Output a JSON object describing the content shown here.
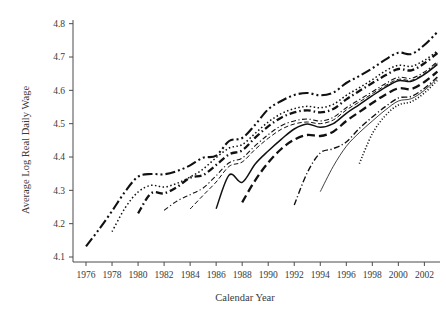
{
  "chart_data": {
    "type": "line",
    "title": "",
    "xlabel": "Calendar Year",
    "ylabel": "Average Log Real Daily Wage",
    "xlim": [
      1975,
      2003.2
    ],
    "ylim": [
      4.085,
      4.805
    ],
    "xticks": [
      1976,
      1978,
      1980,
      1982,
      1984,
      1986,
      1988,
      1990,
      1992,
      1994,
      1996,
      1998,
      2000,
      2002
    ],
    "xtick_labels": [
      "1976",
      "1978",
      "1980",
      "1982",
      "1984",
      "1986",
      "1988",
      "1990",
      "1992",
      "1994",
      "1996",
      "1998",
      "2000",
      "2002"
    ],
    "yticks": [
      4.1,
      4.2,
      4.3,
      4.4,
      4.5,
      4.6,
      4.7,
      4.8
    ],
    "ytick_labels": [
      "4.1",
      "4.2",
      "4.3",
      "4.4",
      "4.5",
      "4.6",
      "4.7",
      "4.8"
    ],
    "grid": false,
    "legend": "none",
    "line_color": "#111111",
    "series": [
      {
        "name": "cohort-1976",
        "dash": "10,3,2,3,2,3",
        "width": 2.1,
        "x": [
          1976,
          1977,
          1978,
          1979,
          1980,
          1981,
          1982,
          1983,
          1984,
          1985,
          1986,
          1987,
          1988,
          1989,
          1990,
          1991,
          1992,
          1993,
          1994,
          1995,
          1996,
          1997,
          1998,
          1999,
          2000,
          2001,
          2002,
          2003
        ],
        "values": [
          4.132,
          4.183,
          4.238,
          4.296,
          4.341,
          4.349,
          4.348,
          4.358,
          4.375,
          4.398,
          4.404,
          4.448,
          4.457,
          4.497,
          4.543,
          4.568,
          4.586,
          4.592,
          4.585,
          4.593,
          4.622,
          4.643,
          4.666,
          4.692,
          4.713,
          4.709,
          4.736,
          4.775
        ]
      },
      {
        "name": "cohort-1978",
        "dash": "1.5,2.4",
        "width": 1.5,
        "x": [
          1978,
          1979,
          1980,
          1981,
          1982,
          1983,
          1984,
          1985,
          1986,
          1987,
          1988,
          1989,
          1990,
          1991,
          1992,
          1993,
          1994,
          1995,
          1996,
          1997,
          1998,
          1999,
          2000,
          2001,
          2002,
          2003
        ],
        "values": [
          4.176,
          4.247,
          4.295,
          4.315,
          4.31,
          4.321,
          4.34,
          4.364,
          4.398,
          4.427,
          4.437,
          4.471,
          4.505,
          4.53,
          4.545,
          4.552,
          4.548,
          4.558,
          4.585,
          4.608,
          4.632,
          4.658,
          4.675,
          4.672,
          4.69,
          4.718
        ]
      },
      {
        "name": "cohort-1980",
        "dash": "7,3,1.5,3",
        "width": 2.3,
        "x": [
          1980,
          1981,
          1982,
          1983,
          1984,
          1985,
          1986,
          1987,
          1988,
          1989,
          1990,
          1991,
          1992,
          1993,
          1994,
          1995,
          1996,
          1997,
          1998,
          1999,
          2000,
          2001,
          2002,
          2003
        ],
        "values": [
          4.231,
          4.291,
          4.291,
          4.31,
          4.338,
          4.346,
          4.376,
          4.408,
          4.42,
          4.458,
          4.492,
          4.518,
          4.534,
          4.54,
          4.534,
          4.544,
          4.573,
          4.598,
          4.622,
          4.645,
          4.664,
          4.66,
          4.681,
          4.712
        ]
      },
      {
        "name": "cohort-1982",
        "dash": "5,2.5,1.2,2.5",
        "width": 1.1,
        "x": [
          1982,
          1983,
          1984,
          1985,
          1986,
          1987,
          1988,
          1989,
          1990,
          1991,
          1992,
          1993,
          1994,
          1995,
          1996,
          1997,
          1998,
          1999,
          2000,
          2001,
          2002,
          2003
        ],
        "values": [
          4.24,
          4.268,
          4.287,
          4.307,
          4.344,
          4.383,
          4.397,
          4.434,
          4.467,
          4.494,
          4.508,
          4.514,
          4.508,
          4.519,
          4.548,
          4.572,
          4.596,
          4.62,
          4.639,
          4.636,
          4.655,
          4.686
        ]
      },
      {
        "name": "cohort-1984",
        "dash": "4.5,2.5",
        "width": 1.0,
        "x": [
          1984,
          1985,
          1986,
          1987,
          1988,
          1989,
          1990,
          1991,
          1992,
          1993,
          1994,
          1995,
          1996,
          1997,
          1998,
          1999,
          2000,
          2001,
          2002,
          2003
        ],
        "values": [
          4.244,
          4.285,
          4.325,
          4.372,
          4.385,
          4.423,
          4.456,
          4.483,
          4.499,
          4.505,
          4.5,
          4.511,
          4.541,
          4.565,
          4.59,
          4.614,
          4.633,
          4.63,
          4.65,
          4.681
        ]
      },
      {
        "name": "cohort-1986",
        "dash": "none",
        "width": 1.5,
        "x": [
          1986,
          1987,
          1988,
          1989,
          1990,
          1991,
          1992,
          1993,
          1994,
          1995,
          1996,
          1997,
          1998,
          1999,
          2000,
          2001,
          2002,
          2003
        ],
        "values": [
          4.245,
          4.346,
          4.324,
          4.379,
          4.418,
          4.453,
          4.484,
          4.499,
          4.489,
          4.5,
          4.531,
          4.557,
          4.584,
          4.609,
          4.629,
          4.627,
          4.648,
          4.678
        ]
      },
      {
        "name": "cohort-1988",
        "dash": "8,4",
        "width": 2.3,
        "x": [
          1988,
          1989,
          1990,
          1991,
          1992,
          1993,
          1994,
          1995,
          1996,
          1997,
          1998,
          1999,
          2000,
          2001,
          2002,
          2003
        ],
        "values": [
          4.264,
          4.33,
          4.383,
          4.424,
          4.452,
          4.466,
          4.463,
          4.476,
          4.508,
          4.535,
          4.562,
          4.587,
          4.606,
          4.604,
          4.625,
          4.656
        ]
      },
      {
        "name": "cohort-1992",
        "dash": "6,2.5,1.2,2.5",
        "width": 1.4,
        "x": [
          1992,
          1993,
          1994,
          1995,
          1996,
          1997,
          1998,
          1999,
          2000,
          2001,
          2002,
          2003
        ],
        "values": [
          4.256,
          4.353,
          4.412,
          4.425,
          4.445,
          4.486,
          4.52,
          4.551,
          4.577,
          4.582,
          4.606,
          4.64
        ]
      },
      {
        "name": "cohort-1994",
        "dash": "none",
        "width": 0.8,
        "x": [
          1994,
          1995,
          1996,
          1997,
          1998,
          1999,
          2000,
          2001,
          2002,
          2003
        ],
        "values": [
          4.296,
          4.372,
          4.432,
          4.473,
          4.508,
          4.541,
          4.568,
          4.575,
          4.6,
          4.636
        ]
      },
      {
        "name": "cohort-1997",
        "dash": "1.1,2.0",
        "width": 1.6,
        "x": [
          1997,
          1998,
          1999,
          2000,
          2001,
          2002,
          2003
        ],
        "values": [
          4.38,
          4.47,
          4.524,
          4.556,
          4.566,
          4.592,
          4.63
        ]
      }
    ]
  }
}
